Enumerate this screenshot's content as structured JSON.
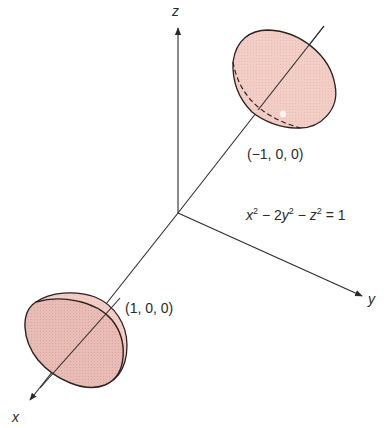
{
  "figure": {
    "equation": {
      "x": "x",
      "sup1": "2",
      "minus1": " − 2",
      "y": "y",
      "sup2": "2",
      "minus2": " − ",
      "z": "z",
      "sup3": "2",
      "eq": " = 1"
    },
    "axes": {
      "x_label": "x",
      "y_label": "y",
      "z_label": "z"
    },
    "points": {
      "upper_vertex": "(−1, 0, 0)",
      "lower_vertex": "(1, 0, 0)"
    },
    "colors": {
      "sheet_fill": "#f3cec6",
      "sheet_fill_dark": "#e2b6ae",
      "outline": "#2b2020",
      "axis": "#2a2a2a"
    }
  }
}
